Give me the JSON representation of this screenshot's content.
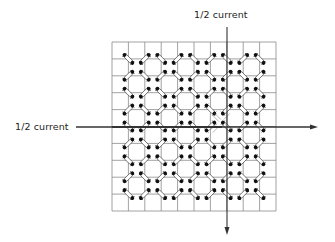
{
  "diagram": {
    "title_top": "1/2 current",
    "title_left": "1/2 current",
    "grid": {
      "left": 112,
      "top": 42,
      "right": 276,
      "bottom": 211,
      "cols": 10,
      "rows": 10,
      "line_color": "#8a8a8a"
    },
    "wires": {
      "horizontal": {
        "y": 127,
        "x_start": 76,
        "x_end": 318,
        "direction": "right",
        "label": "1/2 current"
      },
      "vertical": {
        "x": 227,
        "y_start": 27,
        "y_end": 235,
        "direction": "down",
        "label": "1/2 current"
      },
      "color": "#333333"
    },
    "cores": {
      "description": "ferrite cores at interior grid intersections, alternating diagonal orientation",
      "fill": "#ffffff",
      "stroke": "#444444",
      "dot_color": "#111111",
      "selected_core": {
        "col": 7,
        "row": 5,
        "note": "core at intersection of both half-current wires, shown with switching marks"
      }
    }
  }
}
